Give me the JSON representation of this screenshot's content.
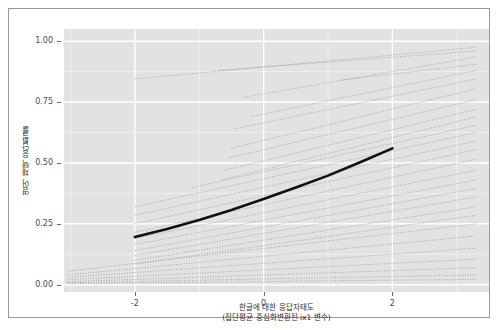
{
  "figure": {
    "background": "#ffffff",
    "panel_background": "#e2e2e2",
    "grid_color": "#ffffff",
    "frame_color": "#9a9a9a"
  },
  "axes": {
    "y_ticks": [
      "1.00",
      "0.75",
      "0.50",
      "0.25",
      "0.00"
    ],
    "x_ticks": [
      "-2",
      "0",
      "2"
    ],
    "y_title": "영어 채택 응답확률",
    "x_title_line1": "한글에 대한 응답자태도",
    "x_title_line2": "(집단평균 중심화변환된 ix1 변수)"
  },
  "chart_data": {
    "type": "line",
    "title": "",
    "xlabel": "한글에 대한 응답자태도 (집단평균 중심화변환된 ix1 변수)",
    "ylabel": "영어 채택 응답확률",
    "xlim": [
      -3.1,
      3.5
    ],
    "ylim": [
      -0.03,
      1.05
    ],
    "xticks": [
      -2,
      0,
      2
    ],
    "yticks": [
      0.0,
      0.25,
      0.5,
      0.75,
      1.0
    ],
    "grid": true,
    "legend": "none",
    "series": [
      {
        "name": "fixed-effect average slope",
        "style": "solid-thick-black",
        "color": "#111111",
        "width": 2.6,
        "x": [
          -2.0,
          -1.5,
          -1.0,
          -0.5,
          0.0,
          0.5,
          1.0,
          1.5,
          2.0
        ],
        "y": [
          0.196,
          0.229,
          0.266,
          0.307,
          0.352,
          0.399,
          0.448,
          0.503,
          0.56
        ]
      },
      {
        "name": "cluster 1",
        "style": "dotted-thin-grey",
        "color": "#8a8a8a",
        "x": [
          -2.0,
          3.3
        ],
        "y": [
          0.845,
          0.975
        ]
      },
      {
        "name": "cluster 2",
        "style": "dotted-thin-grey",
        "color": "#8a8a8a",
        "x": [
          -0.7,
          3.3
        ],
        "y": [
          0.88,
          0.96
        ]
      },
      {
        "name": "cluster 3",
        "style": "dotted-thin-grey",
        "color": "#8a8a8a",
        "x": [
          -0.3,
          3.3
        ],
        "y": [
          0.77,
          0.935
        ]
      },
      {
        "name": "cluster 4",
        "style": "dotted-thin-grey",
        "color": "#8a8a8a",
        "x": [
          1.2,
          3.3
        ],
        "y": [
          0.84,
          0.905
        ]
      },
      {
        "name": "cluster 5",
        "style": "dotted-thin-grey",
        "color": "#8a8a8a",
        "x": [
          -0.2,
          3.3
        ],
        "y": [
          0.69,
          0.88
        ]
      },
      {
        "name": "cluster 6",
        "style": "dotted-thin-grey",
        "color": "#8a8a8a",
        "x": [
          -0.45,
          3.3
        ],
        "y": [
          0.64,
          0.845
        ]
      },
      {
        "name": "cluster 7",
        "style": "dotted-thin-grey",
        "color": "#8a8a8a",
        "x": [
          -0.5,
          3.3
        ],
        "y": [
          0.56,
          0.805
        ]
      },
      {
        "name": "cluster 8",
        "style": "dotted-thin-grey",
        "color": "#8a8a8a",
        "x": [
          -0.55,
          3.3
        ],
        "y": [
          0.52,
          0.76
        ]
      },
      {
        "name": "cluster 9",
        "style": "dotted-thin-grey",
        "color": "#8a8a8a",
        "x": [
          -0.6,
          3.3
        ],
        "y": [
          0.47,
          0.72
        ]
      },
      {
        "name": "cluster 10",
        "style": "dotted-thin-grey",
        "color": "#8a8a8a",
        "x": [
          -0.65,
          3.3
        ],
        "y": [
          0.43,
          0.69
        ]
      },
      {
        "name": "cluster 11",
        "style": "dotted-thin-grey",
        "color": "#8a8a8a",
        "x": [
          -1.1,
          3.3
        ],
        "y": [
          0.4,
          0.655
        ]
      },
      {
        "name": "cluster 12",
        "style": "dotted-thin-grey",
        "color": "#8a8a8a",
        "x": [
          -2.0,
          3.3
        ],
        "y": [
          0.32,
          0.625
        ]
      },
      {
        "name": "cluster 13",
        "style": "dotted-thin-grey",
        "color": "#8a8a8a",
        "x": [
          -2.0,
          3.3
        ],
        "y": [
          0.285,
          0.59
        ]
      },
      {
        "name": "cluster 14",
        "style": "dotted-thin-grey",
        "color": "#8a8a8a",
        "x": [
          -2.0,
          3.3
        ],
        "y": [
          0.25,
          0.555
        ]
      },
      {
        "name": "cluster 15",
        "style": "dotted-thin-grey",
        "color": "#8a8a8a",
        "x": [
          -2.0,
          3.3
        ],
        "y": [
          0.215,
          0.515
        ]
      },
      {
        "name": "cluster 16",
        "style": "dotted-thin-grey",
        "color": "#8a8a8a",
        "x": [
          -2.0,
          3.3
        ],
        "y": [
          0.19,
          0.47
        ]
      },
      {
        "name": "cluster 17",
        "style": "dotted-thin-grey",
        "color": "#8a8a8a",
        "x": [
          -2.0,
          3.3
        ],
        "y": [
          0.165,
          0.43
        ]
      },
      {
        "name": "cluster 18",
        "style": "dotted-thin-grey",
        "color": "#8a8a8a",
        "x": [
          -2.0,
          3.3
        ],
        "y": [
          0.14,
          0.395
        ]
      },
      {
        "name": "cluster 19",
        "style": "dotted-thin-grey",
        "color": "#8a8a8a",
        "x": [
          -2.0,
          3.3
        ],
        "y": [
          0.12,
          0.36
        ]
      },
      {
        "name": "cluster 20",
        "style": "dotted-thin-grey",
        "color": "#8a8a8a",
        "x": [
          -2.0,
          3.3
        ],
        "y": [
          0.1,
          0.32
        ]
      },
      {
        "name": "cluster 21",
        "style": "dotted-thin-grey",
        "color": "#8a8a8a",
        "x": [
          -2.0,
          3.3
        ],
        "y": [
          0.085,
          0.285
        ]
      },
      {
        "name": "cluster 22",
        "style": "dotted-thin-grey",
        "color": "#8a8a8a",
        "x": [
          -3.05,
          3.3
        ],
        "y": [
          0.055,
          0.25
        ]
      },
      {
        "name": "cluster 23",
        "style": "dotted-thin-grey",
        "color": "#8a8a8a",
        "x": [
          -3.05,
          3.3
        ],
        "y": [
          0.04,
          0.2
        ]
      },
      {
        "name": "cluster 24",
        "style": "dotted-thin-grey",
        "color": "#8a8a8a",
        "x": [
          -3.05,
          3.3
        ],
        "y": [
          0.03,
          0.15
        ]
      },
      {
        "name": "cluster 25",
        "style": "dotted-thin-grey",
        "color": "#8a8a8a",
        "x": [
          -3.05,
          3.3
        ],
        "y": [
          0.02,
          0.105
        ]
      },
      {
        "name": "cluster 26",
        "style": "dotted-thin-grey",
        "color": "#8a8a8a",
        "x": [
          -3.05,
          3.3
        ],
        "y": [
          0.012,
          0.07
        ]
      },
      {
        "name": "cluster 27",
        "style": "dotted-thin-grey",
        "color": "#8a8a8a",
        "x": [
          -3.05,
          3.3
        ],
        "y": [
          0.008,
          0.04
        ]
      },
      {
        "name": "cluster 28",
        "style": "dotted-thin-grey",
        "color": "#8a8a8a",
        "x": [
          -3.05,
          3.3
        ],
        "y": [
          0.004,
          0.022
        ]
      }
    ]
  }
}
